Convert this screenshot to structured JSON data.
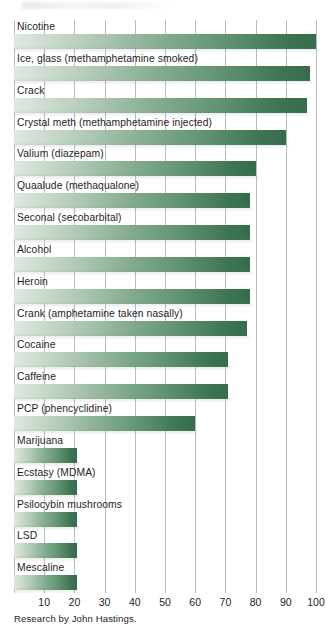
{
  "chart_data": {
    "type": "bar",
    "orientation": "horizontal",
    "title": "",
    "xlabel": "",
    "ylabel": "",
    "xlim": [
      0,
      100
    ],
    "grid": true,
    "legend": false,
    "source_note": "Research by John Hastings.",
    "xticks": [
      10,
      20,
      30,
      40,
      50,
      60,
      70,
      80,
      90,
      100
    ],
    "categories": [
      "Nicotine",
      "Ice, glass (methamphetamine smoked)",
      "Crack",
      "Crystal meth (methamphetamine injected)",
      "Valium (diazepam)",
      "Quaalude (methaqualone)",
      "Seconal (secobarbital)",
      "Alcohol",
      "Heroin",
      "Crank (amphetamine taken nasally)",
      "Cocaine",
      "Caffeine",
      "PCP (phencyclidine)",
      "Marijuana",
      "Ecstasy (MDMA)",
      "Psilocybin mushrooms",
      "LSD",
      "Mescaline"
    ],
    "values": [
      100,
      98,
      97,
      90,
      80,
      78,
      78,
      78,
      78,
      77,
      71,
      71,
      60,
      21,
      21,
      21,
      21,
      21
    ]
  },
  "colors": {
    "bar_gradient_start": "#dfe9df",
    "bar_gradient_end": "#366c4c",
    "gridline": "#b9bcbd",
    "text": "#1d1d1d",
    "background": "#ffffff"
  }
}
